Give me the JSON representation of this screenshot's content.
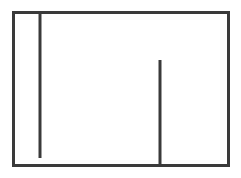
{
  "canvas": {
    "width": 241,
    "height": 178,
    "background_color": "#ffffff",
    "title": "Line Diagram"
  },
  "style": {
    "stroke_color": "#3a3a3a",
    "stroke_width": 3,
    "fill": "none"
  },
  "chart_data": {
    "type": "line",
    "title": "",
    "subtitle": "",
    "xlabel": "",
    "ylabel": "",
    "grid": false,
    "legend_position": "none",
    "xlim": [
      0,
      241
    ],
    "ylim": [
      0,
      178
    ],
    "annotations": [],
    "tick_labels": {
      "x": [],
      "y": []
    },
    "series": [
      {
        "name": "outer-rectangle",
        "shape": "rect",
        "x": 12,
        "y": 11,
        "width": 218,
        "height": 156
      },
      {
        "name": "left-interior-vertical-line",
        "shape": "line",
        "x1": 40,
        "y1": 11,
        "x2": 40,
        "y2": 158
      },
      {
        "name": "center-right-interior-vertical-line",
        "shape": "line",
        "x1": 160,
        "y1": 60,
        "x2": 160,
        "y2": 167
      }
    ]
  },
  "shapes": {
    "rectangle": {
      "label": "outer-rectangle",
      "left": 12,
      "top": 11,
      "right": 230,
      "bottom": 167,
      "width": 218,
      "height": 156
    },
    "line_left": {
      "label": "left-interior-vertical-line",
      "x": 40,
      "top": 11,
      "bottom": 158,
      "length": 147,
      "attached_edge": "top",
      "free_end": "bottom"
    },
    "line_center": {
      "label": "center-right-interior-vertical-line",
      "x": 160,
      "top": 60,
      "bottom": 167,
      "length": 107,
      "attached_edge": "bottom",
      "free_end": "top"
    }
  }
}
